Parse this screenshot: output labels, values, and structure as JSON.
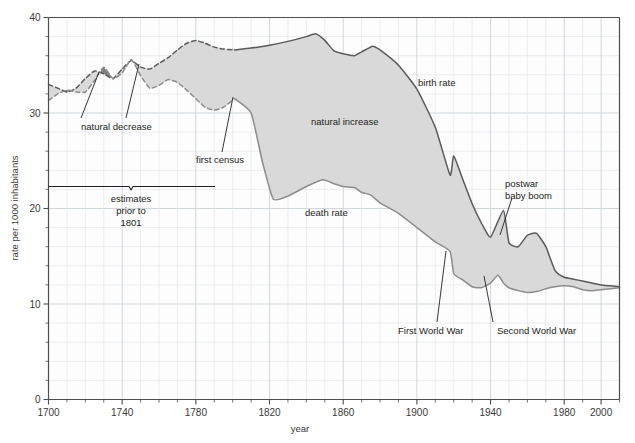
{
  "chart_data": {
    "type": "area",
    "title": "",
    "xlabel": "year",
    "ylabel": "rate per 1000 inhabitants",
    "xlim": [
      1700,
      2010
    ],
    "ylim": [
      0,
      40
    ],
    "grid": true,
    "legend_position": "inline-annotations",
    "x_ticks": [
      1700,
      1740,
      1780,
      1820,
      1860,
      1900,
      1940,
      1980,
      2000
    ],
    "x_tick_labels": [
      "1700",
      "1740",
      "1780",
      "1820",
      "1860",
      "1900",
      "1940",
      "1980",
      "2000"
    ],
    "x_minor_step": 10,
    "y_ticks": [
      0,
      10,
      20,
      30,
      40
    ],
    "y_tick_labels": [
      "0",
      "10",
      "20",
      "30",
      "40"
    ],
    "y_minor_step": 2,
    "estimates_boundary_year": 1801,
    "series": [
      {
        "name": "birth rate",
        "style_before_1801": "dashed",
        "style_after_1801": "solid",
        "x": [
          1700,
          1705,
          1710,
          1715,
          1720,
          1725,
          1730,
          1735,
          1740,
          1745,
          1750,
          1755,
          1760,
          1765,
          1770,
          1775,
          1780,
          1785,
          1790,
          1795,
          1801,
          1810,
          1820,
          1830,
          1840,
          1845,
          1850,
          1855,
          1860,
          1866,
          1870,
          1876,
          1880,
          1890,
          1900,
          1910,
          1918,
          1920,
          1925,
          1930,
          1935,
          1940,
          1947,
          1950,
          1955,
          1960,
          1965,
          1970,
          1975,
          1980,
          1985,
          1990,
          1995,
          2000,
          2005,
          2010
        ],
        "values": [
          33.0,
          32.6,
          32.2,
          32.6,
          33.6,
          34.4,
          34.1,
          33.6,
          34.6,
          35.5,
          34.8,
          34.6,
          35.2,
          35.8,
          36.6,
          37.3,
          37.6,
          37.3,
          36.9,
          36.7,
          36.6,
          36.8,
          37.1,
          37.5,
          38.0,
          38.3,
          37.6,
          36.5,
          36.2,
          36.0,
          36.4,
          37.0,
          36.6,
          35.0,
          32.5,
          28.5,
          23.5,
          25.5,
          23.0,
          20.5,
          18.5,
          17.0,
          19.8,
          16.4,
          16.0,
          17.2,
          17.4,
          16.0,
          13.5,
          12.8,
          12.6,
          12.4,
          12.2,
          12.0,
          11.9,
          11.8
        ],
        "color": "#5a5a5a"
      },
      {
        "name": "death rate",
        "style_before_1801": "dashed",
        "style_after_1801": "solid",
        "x": [
          1700,
          1705,
          1710,
          1715,
          1720,
          1725,
          1730,
          1735,
          1740,
          1745,
          1750,
          1755,
          1760,
          1765,
          1770,
          1775,
          1780,
          1785,
          1790,
          1795,
          1801,
          1810,
          1816,
          1822,
          1830,
          1840,
          1849,
          1855,
          1860,
          1866,
          1870,
          1875,
          1880,
          1890,
          1900,
          1910,
          1918,
          1920,
          1925,
          1930,
          1935,
          1940,
          1944,
          1947,
          1950,
          1955,
          1960,
          1965,
          1970,
          1975,
          1980,
          1985,
          1990,
          1995,
          2000,
          2005,
          2010
        ],
        "values": [
          31.3,
          32.0,
          32.4,
          32.2,
          32.2,
          33.4,
          34.8,
          33.6,
          34.2,
          35.6,
          33.9,
          32.6,
          32.9,
          33.5,
          33.2,
          32.4,
          31.5,
          30.6,
          30.3,
          30.6,
          31.5,
          30.0,
          25.0,
          21.0,
          21.3,
          22.3,
          23.0,
          22.6,
          22.3,
          22.2,
          21.7,
          21.4,
          20.6,
          19.5,
          18.0,
          16.5,
          15.5,
          13.2,
          12.5,
          11.8,
          11.7,
          12.2,
          13.0,
          12.2,
          11.7,
          11.4,
          11.2,
          11.3,
          11.6,
          11.8,
          11.9,
          11.8,
          11.5,
          11.4,
          11.5,
          11.6,
          11.7
        ],
        "color": "#8c8c8c"
      }
    ],
    "regions": [
      {
        "name": "natural increase",
        "fill": "#d9d9d9",
        "description": "area between birth rate and death rate where birth rate exceeds death rate"
      },
      {
        "name": "natural decrease",
        "fill": "#7f7f7f",
        "description": "areas where death rate exceeds birth rate, around 1710-1725 and 1728-1745"
      }
    ],
    "annotations": [
      {
        "id": "natural-decrease",
        "label": "natural decrease",
        "points_to_years": [
          1718,
          1743
        ],
        "type": "leader-lines"
      },
      {
        "id": "first-census",
        "label": "first  census",
        "points_to_year": 1801,
        "points_to_value": 31.5,
        "type": "leader-line"
      },
      {
        "id": "estimates-bracket",
        "label_lines": [
          "estimates",
          "prior to",
          "1801"
        ],
        "span_years": [
          1700,
          1801
        ],
        "type": "brace"
      },
      {
        "id": "natural-increase",
        "label": "natural increase",
        "type": "region-label"
      },
      {
        "id": "birth-rate",
        "label": "birth rate",
        "type": "series-label"
      },
      {
        "id": "death-rate",
        "label": "death rate",
        "type": "series-label"
      },
      {
        "id": "first-world-war",
        "label": "First World War",
        "points_to_year": 1918,
        "points_to_value": 15.5,
        "type": "leader-line"
      },
      {
        "id": "second-world-war",
        "label": "Second World War",
        "points_to_year": 1940,
        "points_to_value": 12.2,
        "type": "leader-line"
      },
      {
        "id": "postwar-baby-boom",
        "label_lines": [
          "postwar",
          "baby boom"
        ],
        "points_to_year": 1947,
        "points_to_value": 19.8,
        "type": "leader-line"
      }
    ]
  },
  "axes": {
    "y_title": "rate per 1000 inhabitants",
    "x_title": "year",
    "y_labels": [
      "40",
      "30",
      "20",
      "10",
      "0"
    ],
    "x_labels": [
      "1700",
      "1740",
      "1780",
      "1820",
      "1860",
      "1900",
      "1940",
      "1980",
      "2000"
    ]
  },
  "labels": {
    "natural_decrease": "natural decrease",
    "first_census": "first  census",
    "estimates_l1": "estimates",
    "estimates_l2": "prior to",
    "estimates_l3": "1801",
    "natural_increase": "natural increase",
    "birth_rate": "birth rate",
    "death_rate": "death rate",
    "first_world_war": "First World War",
    "second_world_war": "Second World War",
    "postwar_l1": "postwar",
    "postwar_l2": "baby boom"
  },
  "colors": {
    "birth_line": "#5a5a5a",
    "death_line": "#8c8c8c",
    "natural_increase_fill": "#d9d9d9",
    "natural_decrease_fill": "#7f7f7f",
    "grid": "#dfe3e8",
    "axis": "#4d4d4d",
    "text": "#231f20",
    "background": "#ffffff"
  }
}
